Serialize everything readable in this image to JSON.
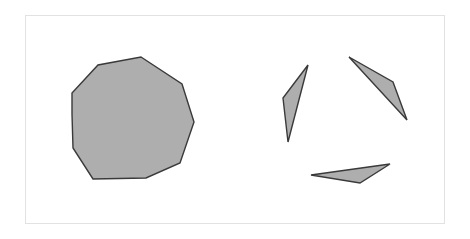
{
  "figure": {
    "canvas": {
      "width": 470,
      "height": 239,
      "background": "#ffffff"
    },
    "frame": {
      "name": "image-border-frame",
      "x": 25.5,
      "y": 15.5,
      "width": 419,
      "height": 208,
      "stroke": "#e2e2e2",
      "stroke_width": 1,
      "fill": "none"
    },
    "style": {
      "shape_fill": "#aeaeae",
      "shape_stroke": "#3a3a3a",
      "shape_stroke_width": 1.4
    },
    "shapes": [
      {
        "id": "decagon",
        "label": "large filled decagon",
        "sides": 10,
        "points": "141,57 182,84 194,122 180,163 146,178 93,179 73,148 72,114 72,93 98,65"
      },
      {
        "id": "triangle-left",
        "label": "thin sliver triangle, left",
        "sides": 3,
        "points": "308,65 283,98 288,142"
      },
      {
        "id": "triangle-upper-right",
        "label": "thin sliver triangle, upper right",
        "sides": 3,
        "points": "349,57 393,82 407,120"
      },
      {
        "id": "triangle-bottom",
        "label": "thin sliver triangle, bottom",
        "sides": 3,
        "points": "311,175 390,164 360,183"
      }
    ]
  }
}
